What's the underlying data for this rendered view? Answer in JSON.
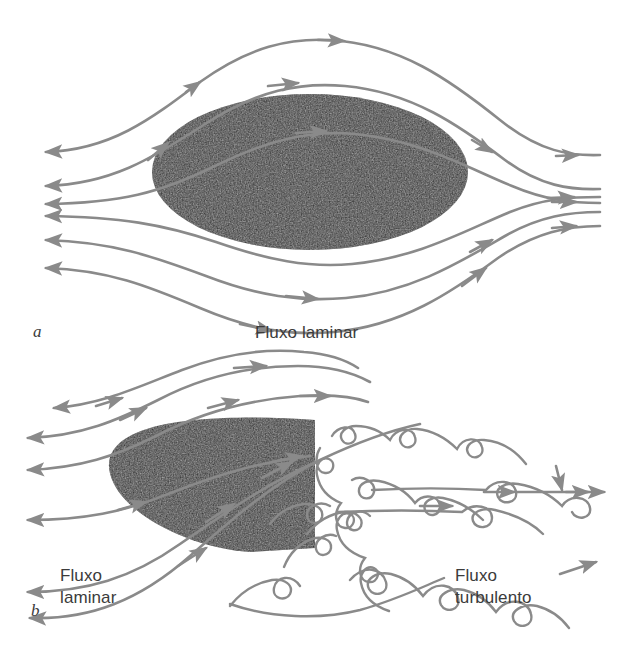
{
  "figure": {
    "background_color": "#ffffff",
    "stream_color": "#8a8a8a",
    "body_color": "#262626",
    "text_color": "#3b3b3b"
  },
  "panels": [
    {
      "letter": "a",
      "caption": "Fluxo laminar",
      "body_shape": "ellipse",
      "description": "Streamlined ellipse with laminar flow passing smoothly around it",
      "streamline_count": 6
    },
    {
      "letter": "b",
      "caption_left": "Fluxo\nlaminar",
      "caption_right": "Fluxo\nturbulento",
      "body_shape": "half-teardrop-flat-back",
      "description": "Blunt-backed body with laminar flow upstream and turbulent eddies downstream",
      "streamline_count": 5
    }
  ],
  "labels": {
    "panel_a_letter": "a",
    "panel_a_caption": "Fluxo laminar",
    "panel_b_letter": "b",
    "panel_b_caption_left": "Fluxo\nlaminar",
    "panel_b_caption_right": "Fluxo\nturbulento"
  }
}
